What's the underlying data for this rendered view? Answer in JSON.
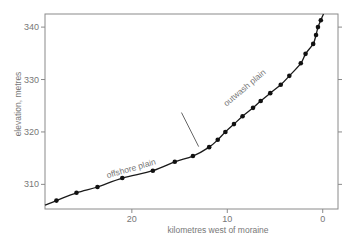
{
  "chart_data": {
    "type": "line",
    "title": "",
    "xlabel": "kilometres west of moraine",
    "ylabel": "elevation, metres",
    "xlim": [
      29.1,
      -1.6
    ],
    "ylim": [
      305.3,
      342.5
    ],
    "x_reversed": true,
    "grid": false,
    "legend": null,
    "x_ticks": [
      20,
      10,
      0
    ],
    "x_tick_labels": [
      "20",
      "10",
      "0"
    ],
    "y_ticks": [
      310,
      320,
      330,
      340
    ],
    "y_tick_labels": [
      "310",
      "320",
      "330",
      "340"
    ],
    "series": [
      {
        "name": "surveyed elevations",
        "style": "points-with-smooth-line",
        "x": [
          27.9,
          25.8,
          23.6,
          21.0,
          17.8,
          15.5,
          13.6,
          11.9,
          11.0,
          10.2,
          9.3,
          8.4,
          7.3,
          6.5,
          5.5,
          4.4,
          3.5,
          2.3,
          1.8,
          1.0,
          0.7,
          0.5,
          0.2
        ],
        "y": [
          306.9,
          308.4,
          309.5,
          311.2,
          312.6,
          314.3,
          315.4,
          317.1,
          318.5,
          320.0,
          321.5,
          323.0,
          324.6,
          325.9,
          327.4,
          329.0,
          330.7,
          333.1,
          334.9,
          336.8,
          338.5,
          340.0,
          341.3
        ]
      }
    ],
    "annotations": [
      {
        "text": "offshore plain",
        "x": 20.0,
        "y": 312.5,
        "rotation": -16
      },
      {
        "text": "outwash plain",
        "x": 8.0,
        "y": 328.0,
        "rotation": -40
      },
      {
        "type": "marker-line",
        "from": [
          14.8,
          323.7
        ],
        "to": [
          13.0,
          317.2
        ],
        "note": "break in slope between plains"
      }
    ]
  },
  "plot": {
    "x_title": "kilometres west of moraine",
    "y_title": "elevation, metres",
    "annotation_offshore": "offshore plain",
    "annotation_outwash": "outwash plain"
  }
}
